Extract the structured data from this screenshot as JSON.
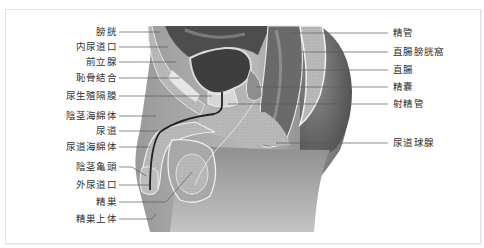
{
  "diagram": {
    "colors": {
      "background": "#ffffff",
      "frame": "#e4e4e4",
      "label_text": "#333333",
      "leader_line": "#555555"
    },
    "left_labels": [
      {
        "text": "膀胱",
        "y": 32,
        "target_x": 160
      },
      {
        "text": "内尿道口",
        "y": 47,
        "target_x": 165
      },
      {
        "text": "前立腺",
        "y": 62,
        "target_x": 160
      },
      {
        "text": "恥骨結合",
        "y": 78,
        "target_x": 160
      },
      {
        "text": "尿生殖隔膜",
        "y": 96,
        "target_x": 210
      },
      {
        "text": "陰茎海綿体",
        "y": 116,
        "target_x": 155
      },
      {
        "text": "尿道",
        "y": 131,
        "target_x": 158
      },
      {
        "text": "尿道海綿体",
        "y": 147,
        "target_x": 152
      },
      {
        "text": "陰茎亀頭",
        "y": 167,
        "target_x": 142
      },
      {
        "text": "外尿道口",
        "y": 185,
        "target_x": 148
      },
      {
        "text": "精巣",
        "y": 202,
        "target_x": 188
      },
      {
        "text": "精巣上体",
        "y": 219,
        "target_x": 158
      }
    ],
    "right_labels": [
      {
        "text": "精管",
        "y": 33,
        "target_x": 290
      },
      {
        "text": "直腸膀胱窩",
        "y": 52,
        "target_x": 300
      },
      {
        "text": "直腸",
        "y": 70,
        "target_x": 300
      },
      {
        "text": "精嚢",
        "y": 87,
        "target_x": 270
      },
      {
        "text": "射精管",
        "y": 104,
        "target_x": 260
      },
      {
        "text": "尿道球腺",
        "y": 143,
        "target_x": 270
      }
    ]
  }
}
